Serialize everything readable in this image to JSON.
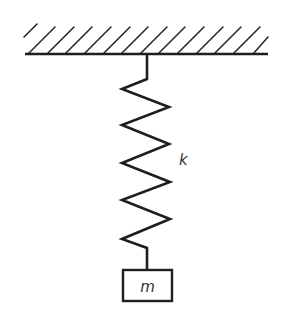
{
  "diagram": {
    "ceiling": {
      "x1": 25,
      "x2": 268,
      "y": 54,
      "hatch_count": 14,
      "hatch_label": "fixed support"
    },
    "spring": {
      "label": "k",
      "points": [
        [
          147,
          54
        ],
        [
          147,
          79
        ],
        [
          122,
          89
        ],
        [
          169,
          107
        ],
        [
          122,
          125
        ],
        [
          169,
          144
        ],
        [
          122,
          163
        ],
        [
          170,
          182
        ],
        [
          122,
          200
        ],
        [
          170,
          219
        ],
        [
          122,
          239
        ],
        [
          147,
          248
        ],
        [
          147,
          270
        ]
      ]
    },
    "mass": {
      "label": "m",
      "x": 123,
      "y": 270,
      "width": 49,
      "height": 31
    },
    "colors": {
      "line": "#1e1e1e",
      "hatch": "#2a2a2a",
      "text": "#333333",
      "background": "#ffffff"
    }
  }
}
